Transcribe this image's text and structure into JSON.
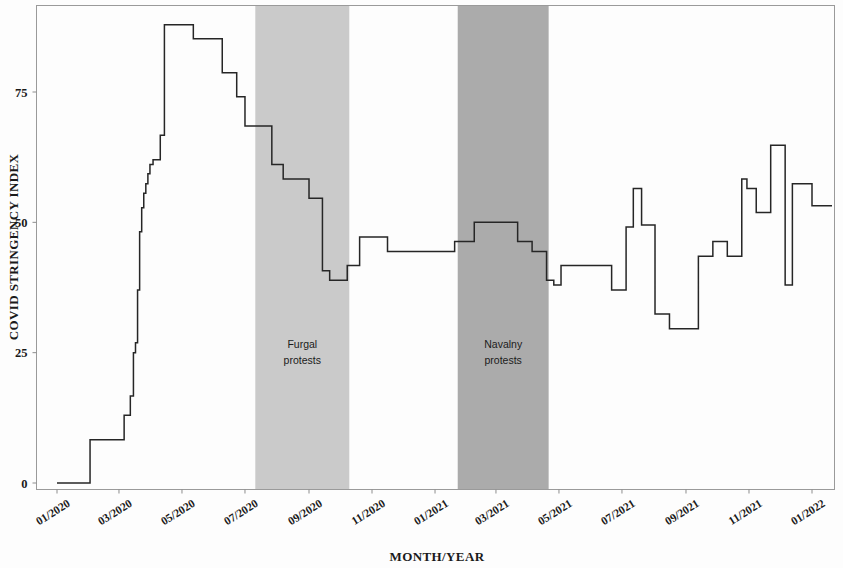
{
  "chart_data": {
    "type": "line",
    "title": "",
    "subtitle": "",
    "xlabel": "MONTH/YEAR",
    "ylabel": "COVID STRINGENCY INDEX",
    "ylim": [
      -2,
      90
    ],
    "yticks": [
      0,
      25,
      50,
      75
    ],
    "ytick_labels": [
      "0",
      "25",
      "50",
      "75"
    ],
    "xlim": [
      "01/2020",
      "01/2022"
    ],
    "xticks": [
      "01/2020",
      "03/2020",
      "05/2020",
      "07/2020",
      "09/2020",
      "11/2020",
      "01/2021",
      "03/2021",
      "05/2021",
      "07/2021",
      "09/2021",
      "11/2021",
      "01/2022"
    ],
    "grid": false,
    "legend": null,
    "line_color": "#262626",
    "series": [
      {
        "name": "COVID Stringency Index",
        "step": "post",
        "x": [
          "2020-01-01",
          "2020-01-22",
          "2020-02-02",
          "2020-02-20",
          "2020-03-01",
          "2020-03-06",
          "2020-03-12",
          "2020-03-15",
          "2020-03-17",
          "2020-03-19",
          "2020-03-21",
          "2020-03-23",
          "2020-03-25",
          "2020-03-27",
          "2020-03-29",
          "2020-03-31",
          "2020-04-03",
          "2020-04-06",
          "2020-04-10",
          "2020-04-14",
          "2020-04-20",
          "2020-05-12",
          "2020-05-26",
          "2020-06-09",
          "2020-06-23",
          "2020-07-01",
          "2020-07-13",
          "2020-07-27",
          "2020-08-07",
          "2020-08-20",
          "2020-09-01",
          "2020-09-08",
          "2020-09-14",
          "2020-09-21",
          "2020-10-01",
          "2020-10-08",
          "2020-10-20",
          "2020-11-16",
          "2020-12-28",
          "2021-01-20",
          "2021-02-08",
          "2021-02-22",
          "2021-03-08",
          "2021-03-22",
          "2021-04-05",
          "2021-04-19",
          "2021-04-26",
          "2021-05-03",
          "2021-06-14",
          "2021-06-21",
          "2021-06-25",
          "2021-06-28",
          "2021-07-05",
          "2021-07-12",
          "2021-07-20",
          "2021-08-02",
          "2021-08-16",
          "2021-08-30",
          "2021-09-13",
          "2021-09-27",
          "2021-10-11",
          "2021-10-25",
          "2021-10-30",
          "2021-11-08",
          "2021-11-22",
          "2021-12-06",
          "2021-12-13",
          "2021-12-27",
          "2022-01-01"
        ],
        "values": [
          0,
          0,
          8.3,
          8.3,
          8.3,
          13.0,
          16.7,
          25.0,
          26.9,
          37.0,
          48.2,
          52.8,
          55.6,
          57.4,
          59.3,
          61.1,
          62.0,
          62.0,
          66.7,
          87.9,
          87.9,
          85.2,
          85.2,
          78.7,
          74.1,
          68.5,
          68.5,
          61.1,
          58.3,
          58.3,
          54.6,
          54.6,
          40.7,
          38.9,
          38.9,
          41.7,
          47.2,
          44.4,
          44.4,
          46.3,
          50.0,
          50.0,
          50.0,
          46.3,
          44.4,
          38.9,
          38.0,
          41.7,
          41.7,
          37.0,
          37.0,
          37.0,
          49.1,
          56.5,
          49.5,
          32.4,
          29.6,
          29.6,
          43.5,
          46.3,
          43.5,
          58.3,
          56.5,
          51.9,
          64.8,
          38.0,
          57.4,
          57.4,
          53.2
        ]
      }
    ],
    "shaded_bands": [
      {
        "id": "furgal",
        "label_line1": "Furgal",
        "label_line2": "protests",
        "start": "2020-07-11",
        "end": "2020-10-10",
        "color": "#c6c6c6",
        "opacity": 0.92
      },
      {
        "id": "navalny",
        "label_line1": "Navalny",
        "label_line2": "protests",
        "start": "2021-01-23",
        "end": "2021-04-21",
        "color": "#a7a7a7",
        "opacity": 0.95
      }
    ]
  }
}
